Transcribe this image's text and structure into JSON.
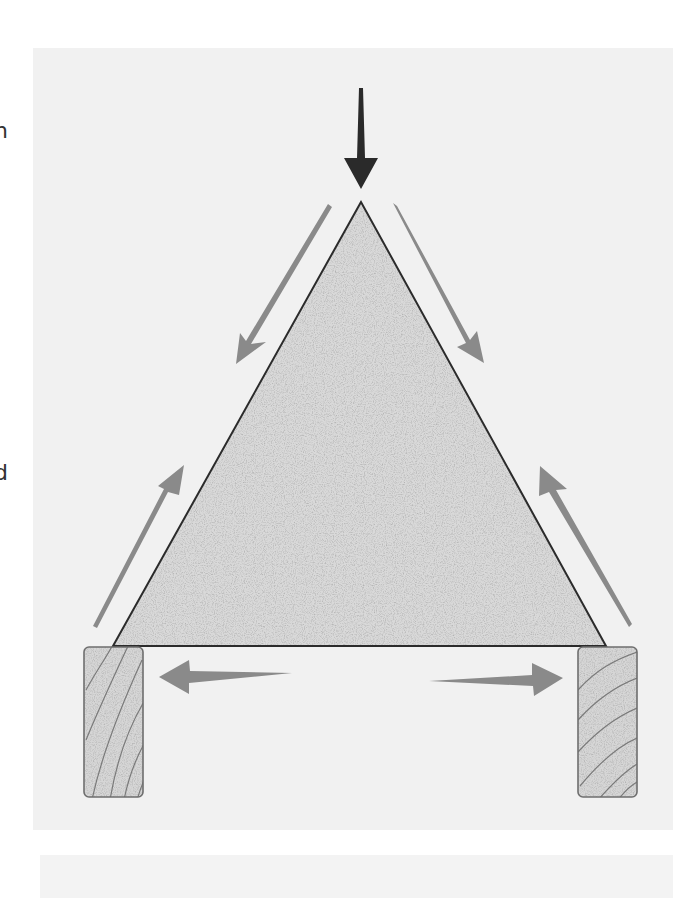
{
  "edge_text": [
    {
      "text": "n",
      "top": 120
    },
    {
      "text": "d",
      "top": 462
    },
    {
      "text": ".",
      "top": 580
    }
  ],
  "colors": {
    "background": "#ffffff",
    "panel": "#f1f1f1",
    "triangle_fill": "#d9d9d9",
    "triangle_stroke": "#2b2b2b",
    "load_arrow": "#2a2a2a",
    "force_arrow": "#8a8a8a",
    "wood_fill": "#d6d6d6",
    "wood_stroke": "#6e6e6e",
    "grain": "#7a7a7a"
  },
  "shapes": {
    "triangle": {
      "apex": [
        361,
        202
      ],
      "base_left": [
        113,
        646
      ],
      "base_right": [
        606,
        646
      ]
    },
    "load_arrow": {
      "from": [
        361,
        88
      ],
      "to": [
        361,
        188
      ],
      "label": "applied load"
    },
    "force_arrows": [
      {
        "name": "upper-left-compression",
        "from": [
          328,
          205
        ],
        "to": [
          236,
          364
        ]
      },
      {
        "name": "upper-right-compression",
        "from": [
          394,
          205
        ],
        "to": [
          484,
          363
        ]
      },
      {
        "name": "lower-left-reaction",
        "from": [
          94,
          628
        ],
        "to": [
          183,
          467
        ]
      },
      {
        "name": "lower-right-reaction",
        "from": [
          630,
          626
        ],
        "to": [
          540,
          467
        ]
      },
      {
        "name": "base-left-thrust",
        "from": [
          292,
          673
        ],
        "to": [
          158,
          676
        ]
      },
      {
        "name": "base-right-thrust",
        "from": [
          428,
          680
        ],
        "to": [
          562,
          678
        ]
      }
    ],
    "supports": [
      {
        "name": "left-support",
        "x": 84,
        "y": 647,
        "w": 59,
        "h": 150
      },
      {
        "name": "right-support",
        "x": 578,
        "y": 647,
        "w": 59,
        "h": 150
      }
    ]
  }
}
